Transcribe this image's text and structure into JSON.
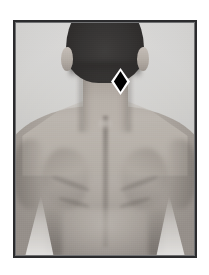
{
  "figure": {
    "alt_text": "Posterior view of a man's upper back, neck and head",
    "frame": {
      "border_color": "#2b2b2d",
      "background_color": "#ffffff"
    },
    "photo": {
      "type": "grayscale-photograph",
      "subject": "human upper back, posterior view",
      "visible_anatomy": [
        "head with dark hair",
        "left ear",
        "right ear",
        "neck",
        "trapezius",
        "spine furrow",
        "left scapula",
        "right scapula",
        "left deltoid",
        "right deltoid",
        "lower back",
        "left arm",
        "right arm"
      ],
      "tones": {
        "hair": "#2a2827",
        "skin_light": "#c9c2bb",
        "skin_mid": "#aaa39c",
        "skin_shadow": "#6e6862",
        "backdrop_light": "#e9e8e6",
        "backdrop_dark": "#bdbcb9"
      }
    },
    "marker": {
      "shape": "diamond",
      "fill_color": "#000000",
      "outline_color": "#ffffff",
      "location_label": "base of skull / suboccipital region",
      "x": 96,
      "y": 46,
      "width": 19,
      "height": 27
    }
  }
}
